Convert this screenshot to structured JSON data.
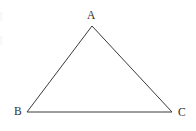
{
  "figure": {
    "name": "triangle-abc",
    "width": 196,
    "height": 131,
    "background_color": "#ffffff",
    "stroke_color": "#3a3a3a",
    "stroke_width": 1,
    "label_color": "#2e2e2e"
  },
  "labels": {
    "apex": "A",
    "bottom_left": "B",
    "bottom_right": "C"
  },
  "artifacts": {
    "top": "|",
    "bottom": "|"
  },
  "chart_data": {
    "type": "scatter",
    "title": "",
    "xlabel": "",
    "ylabel": "",
    "grid": false,
    "legend": null,
    "xlim": [
      0,
      196
    ],
    "ylim": [
      131,
      0
    ],
    "vertices": [
      {
        "label": "A",
        "x": 92,
        "y": 26
      },
      {
        "label": "B",
        "x": 27,
        "y": 112
      },
      {
        "label": "C",
        "x": 172,
        "y": 112
      }
    ],
    "edges": [
      {
        "from": "A",
        "to": "B"
      },
      {
        "from": "B",
        "to": "C"
      },
      {
        "from": "C",
        "to": "A"
      }
    ],
    "label_positions": [
      {
        "label": "A",
        "x": 89,
        "y": 16
      },
      {
        "label": "B",
        "x": 17,
        "y": 113
      },
      {
        "label": "C",
        "x": 181,
        "y": 114
      }
    ]
  }
}
